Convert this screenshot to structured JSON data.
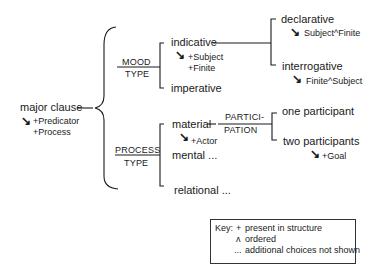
{
  "diagram": {
    "type": "system network",
    "root": {
      "label": "major clause",
      "realizations": [
        "+Predicator",
        "+Process"
      ]
    },
    "systems": [
      {
        "name_top": "MOOD",
        "name_bottom": "TYPE",
        "options": [
          {
            "label": "indicative",
            "realizations": [
              "+Subject",
              "+Finite"
            ],
            "subsystem": {
              "options": [
                {
                  "label": "declarative",
                  "realization": "Subject^Finite"
                },
                {
                  "label": "interrogative",
                  "realization": "Finite^Subject"
                }
              ]
            }
          },
          {
            "label": "imperative"
          }
        ]
      },
      {
        "name_top": "PROCESS",
        "name_bottom": "TYPE",
        "options": [
          {
            "label": "material",
            "realizations": [
              "+Actor"
            ],
            "subsystem": {
              "name_top": "PARTICI-",
              "name_bottom": "PATION",
              "options": [
                {
                  "label": "one participant"
                },
                {
                  "label": "two participants",
                  "realization": "+Goal"
                }
              ]
            }
          },
          {
            "label": "mental ..."
          },
          {
            "label": "relational ..."
          }
        ]
      }
    ],
    "arrow_glyph": "↘"
  },
  "key": {
    "title": "Key:",
    "entries": [
      {
        "symbol": "+",
        "meaning": "present in structure"
      },
      {
        "symbol": "ʌ",
        "meaning": "ordered"
      },
      {
        "symbol": "...",
        "meaning": "additional choices not shown"
      }
    ]
  }
}
